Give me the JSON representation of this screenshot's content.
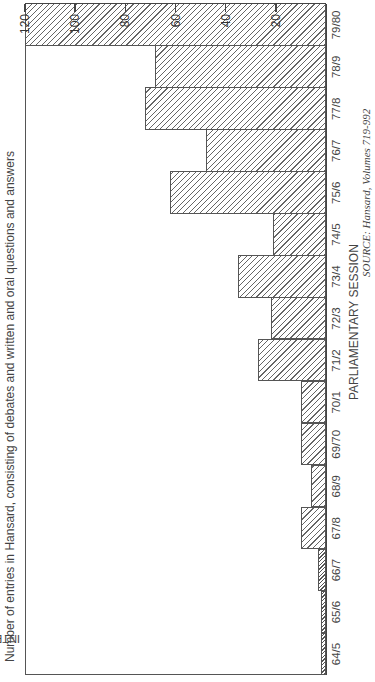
{
  "chart_data": {
    "type": "bar",
    "title": "Number of entries in Hansard, consisting of debates and written and oral questions and answers",
    "xlabel": "PARLIAMENTARY SESSION",
    "ylabel": "INTEREST INDEX: NUMBER OF ENTRIES IN HANSARD",
    "source": "SOURCE: Hansard, Volumes 719-992",
    "orientation_note": "figure rotated 90 degrees counter-clockwise on page",
    "categories": [
      "64/5",
      "65/6",
      "66/7",
      "67/8",
      "68/9",
      "69/70",
      "70/1",
      "71/2",
      "72/3",
      "73/4",
      "74/5",
      "75/6",
      "76/7",
      "77/8",
      "78/9",
      "79/80"
    ],
    "values": [
      2,
      2,
      3,
      10,
      6,
      10,
      10,
      27,
      22,
      35,
      21,
      62,
      48,
      72,
      68,
      120
    ],
    "ylim": [
      0,
      120
    ],
    "yticks": [
      20,
      40,
      60,
      80,
      100,
      120
    ],
    "grid": false,
    "fill": "diagonal hatching",
    "bar_style": [
      "dense",
      "dense",
      "dense",
      "normal",
      "normal",
      "normal",
      "normal",
      "normal",
      "normal",
      "normal",
      "normal",
      "normal",
      "normal",
      "normal",
      "normal",
      "normal"
    ]
  }
}
